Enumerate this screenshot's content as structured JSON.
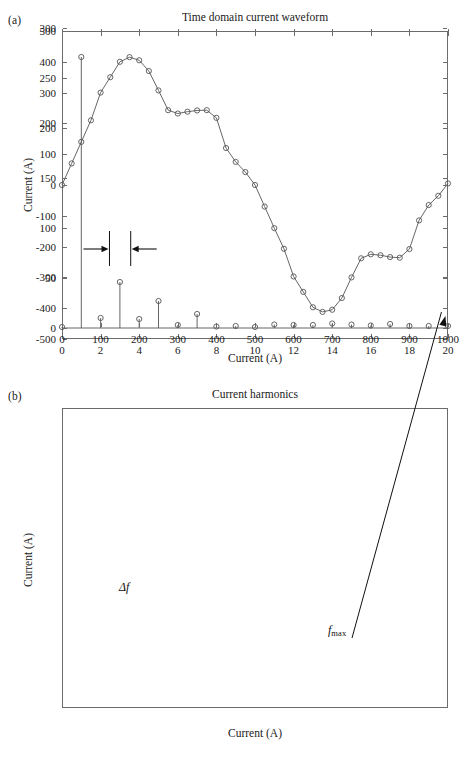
{
  "figure": {
    "panel_a_label": "(a)",
    "panel_b_label": "(b)"
  },
  "chart_data": [
    {
      "type": "line",
      "panel": "(a)",
      "title": "Time domain current waveform",
      "xlabel": "Current (A)",
      "ylabel": "Current (A)",
      "xlim": [
        0,
        20
      ],
      "ylim": [
        -500,
        500
      ],
      "xticks": [
        0,
        2,
        4,
        6,
        8,
        10,
        12,
        14,
        16,
        18,
        20
      ],
      "xticklabels": [
        "0",
        "2",
        "4",
        "6",
        "8",
        "10",
        "12",
        "14",
        "16",
        "18",
        "20"
      ],
      "yticks": [
        -500,
        -400,
        -300,
        -200,
        -100,
        0,
        100,
        200,
        300,
        400,
        500
      ],
      "yticklabels": [
        "-500",
        "-400",
        "-300",
        "-200",
        "-100",
        "0",
        "100",
        "200",
        "300",
        "400",
        "500"
      ],
      "grid": false,
      "legend": null,
      "marker": "circle",
      "line_color": "#555555",
      "marker_color": "#555555",
      "x": [
        0,
        0.5,
        1,
        1.5,
        2,
        2.5,
        3,
        3.5,
        4,
        4.5,
        5,
        5.5,
        6,
        6.5,
        7,
        7.5,
        8,
        8.5,
        9,
        9.5,
        10,
        10.5,
        11,
        11.5,
        12,
        12.5,
        13,
        13.5,
        14,
        14.5,
        15,
        15.5,
        16,
        16.5,
        17,
        17.5,
        18,
        18.5,
        19,
        19.5,
        20
      ],
      "y": [
        0,
        70,
        140,
        210,
        300,
        350,
        400,
        415,
        405,
        370,
        307,
        243,
        232,
        238,
        242,
        243,
        218,
        120,
        75,
        42,
        0,
        -70,
        -140,
        -207,
        -297,
        -347,
        -397,
        -412,
        -405,
        -367,
        -300,
        -238,
        -225,
        -228,
        -234,
        -236,
        -208,
        -115,
        -65,
        -35,
        5
      ]
    },
    {
      "type": "bar",
      "subtype": "stem",
      "panel": "(b)",
      "title": "Current harmonics",
      "xlabel": "Current (A)",
      "ylabel": "Current (A)",
      "xlim": [
        0,
        1000
      ],
      "ylim": [
        0,
        300
      ],
      "xticks": [
        0,
        100,
        200,
        300,
        400,
        500,
        600,
        700,
        800,
        900,
        1000
      ],
      "xticklabels": [
        "0",
        "100",
        "200",
        "300",
        "400",
        "500",
        "600",
        "700",
        "800",
        "900",
        "1000"
      ],
      "yticks": [
        0,
        50,
        100,
        150,
        200,
        250,
        300
      ],
      "yticklabels": [
        "0",
        "50",
        "100",
        "150",
        "200",
        "250",
        "300"
      ],
      "grid": false,
      "legend": null,
      "marker": "circle",
      "line_color": "#555555",
      "marker_color": "#555555",
      "categories": [
        0,
        50,
        100,
        150,
        200,
        250,
        300,
        350,
        400,
        450,
        500,
        550,
        600,
        650,
        700,
        750,
        800,
        850,
        900,
        950,
        1000
      ],
      "values": [
        1,
        271,
        10,
        46,
        9,
        27,
        3,
        14,
        1.5,
        2,
        1,
        3.5,
        3,
        3,
        4.5,
        3.5,
        2.5,
        4,
        2,
        2,
        2
      ],
      "annotations": [
        {
          "name": "delta-f",
          "text": "Δf",
          "x": 150,
          "note": "width marker between two vertical bars with inward arrows, at y≈83"
        },
        {
          "name": "f-max",
          "text": "fmax",
          "x": 1000,
          "note": "arrow pointing to last stem at x=1000"
        }
      ]
    }
  ],
  "annotations": {
    "delta_f_label": "Δf",
    "f_max_label": "f",
    "f_max_sub": "max"
  }
}
